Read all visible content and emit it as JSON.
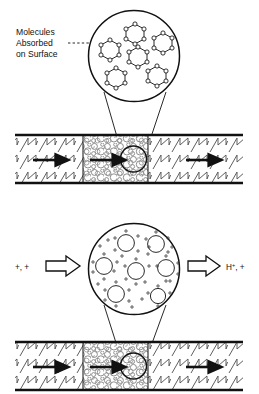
{
  "figure": {
    "panels": [
      {
        "id": "upper",
        "name": "adsorption-panel",
        "annotation_lines": [
          "Molecules",
          "Absorbed",
          "on Surface"
        ],
        "annotation_text": "Molecules Absorbed on Surface",
        "magnifier": {
          "name": "upper-magnifier",
          "content": "hexagonal ring molecules adsorbed on surface",
          "molecule_count": 6,
          "molecule_type": "hexagonal-ring",
          "vertices_per_ring": 6
        },
        "channel": {
          "name": "upper-channel",
          "flow_arrows": 3,
          "sections": [
            "hatched-wall",
            "packed-bed",
            "hatched-wall"
          ]
        }
      },
      {
        "id": "lower",
        "name": "protonation-panel",
        "inlet_label": "+, +",
        "outlet_label": "H+, +",
        "outlet_label_base": "H",
        "outlet_label_sup": "+",
        "outlet_label_tail": ", +",
        "magnifier": {
          "name": "lower-magnifier",
          "content": "protonated molecules with surrounding plus charges",
          "molecule_count": 7,
          "molecule_type": "circle-with-plus-charges"
        },
        "channel": {
          "name": "lower-channel",
          "flow_arrows": 3,
          "sections": [
            "hatched-wall",
            "packed-bed",
            "hatched-wall"
          ]
        }
      }
    ]
  },
  "colors": {
    "ink": "#111111",
    "line": "#333333",
    "hatch": "#555555",
    "background": "#ffffff",
    "packing": "#777777"
  }
}
